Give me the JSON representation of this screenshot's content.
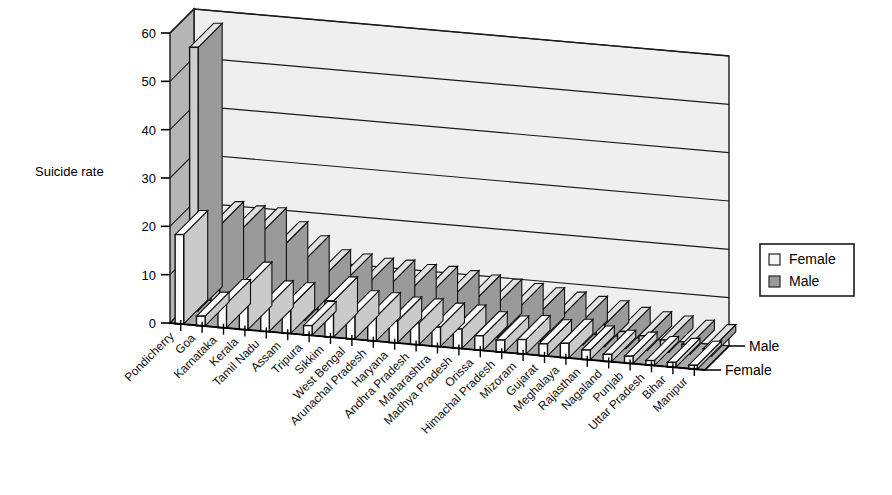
{
  "chart_data": {
    "type": "bar",
    "title": "",
    "subtitle": "",
    "xlabel": "",
    "ylabel": "Suicide rate",
    "zlabel_entries": [
      "Male",
      "Female"
    ],
    "ylim": [
      0,
      60
    ],
    "yticks": [
      0,
      10,
      20,
      30,
      40,
      50,
      60
    ],
    "grid": true,
    "legend_position": "right",
    "projection": "3d-grouped-columns",
    "categories": [
      "Pondicherry",
      "Goa",
      "Karnataka",
      "Kerala",
      "Tamil Nadu",
      "Assam",
      "Tripura",
      "Sikkim",
      "West Bengal",
      "Arunachal Pradesh",
      "Haryana",
      "Andhra Pradesh",
      "Maharashtra",
      "Madhya Pradesh",
      "Orissa",
      "Himachal Pradesh",
      "Mizoram",
      "Gujarat",
      "Meghalaya",
      "Rajasthan",
      "Nagaland",
      "Punjab",
      "Uttar Pradesh",
      "Bihar",
      "Manipur"
    ],
    "series": [
      {
        "name": "Female",
        "color": "#f2f2f2",
        "values": [
          18.5,
          2.0,
          5.0,
          9.0,
          5.5,
          5.5,
          2.0,
          7.5,
          5.0,
          5.0,
          4.5,
          4.5,
          4.0,
          4.0,
          3.0,
          2.5,
          3.0,
          2.5,
          3.0,
          2.0,
          1.5,
          1.5,
          1.0,
          1.0,
          0.8
        ]
      },
      {
        "name": "Male",
        "color": "#b3b3b3",
        "values": [
          54.5,
          18.0,
          17.5,
          17.5,
          15.0,
          12.5,
          10.0,
          9.5,
          9.0,
          9.0,
          8.5,
          8.5,
          8.0,
          7.5,
          7.0,
          6.5,
          6.0,
          5.5,
          5.0,
          4.5,
          3.5,
          3.0,
          2.5,
          2.0,
          1.5
        ]
      }
    ]
  },
  "legend": {
    "items": [
      {
        "label": "Female",
        "swatch": "#f5f5f5"
      },
      {
        "label": "Male",
        "swatch": "#9a9a9a"
      }
    ]
  },
  "axis": {
    "y_title": "Suicide rate",
    "tick_labels": [
      "60",
      "50",
      "40",
      "30",
      "20",
      "10",
      "0"
    ],
    "depth_labels": [
      "Male",
      "Female"
    ]
  }
}
